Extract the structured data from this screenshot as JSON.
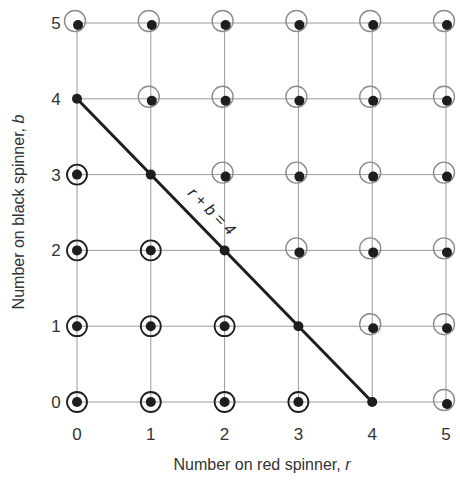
{
  "chart_data": {
    "type": "scatter",
    "title": "",
    "xlabel": "Number on red spinner, r",
    "ylabel": "Number on black spinner, b",
    "xlabel_text": "Number on red spinner, ",
    "xlabel_var": "r",
    "ylabel_text": "Number on black spinner, ",
    "ylabel_var": "b",
    "x_ticks": [
      "0",
      "1",
      "2",
      "3",
      "4",
      "5"
    ],
    "y_ticks": [
      "0",
      "1",
      "2",
      "3",
      "4",
      "5"
    ],
    "xlim": [
      0,
      5
    ],
    "ylim": [
      0,
      5
    ],
    "grid": true,
    "line": {
      "label": "r + b = 4",
      "from": [
        0,
        4
      ],
      "to": [
        4,
        0
      ]
    },
    "point_groups": [
      {
        "name": "r + b < 4 (dark concentric circle)",
        "marker": "dot-in-dark-circle",
        "points": [
          [
            0,
            0
          ],
          [
            1,
            0
          ],
          [
            2,
            0
          ],
          [
            3,
            0
          ],
          [
            0,
            1
          ],
          [
            1,
            1
          ],
          [
            2,
            1
          ],
          [
            0,
            2
          ],
          [
            1,
            2
          ],
          [
            0,
            3
          ]
        ]
      },
      {
        "name": "r + b = 4 (on line, plain dot)",
        "marker": "dot",
        "points": [
          [
            4,
            0
          ],
          [
            3,
            1
          ],
          [
            2,
            2
          ],
          [
            1,
            3
          ],
          [
            0,
            4
          ]
        ]
      },
      {
        "name": "r + b > 4 (light offset circle)",
        "marker": "dot-in-light-offset-circle",
        "points": [
          [
            5,
            0
          ],
          [
            4,
            1
          ],
          [
            5,
            1
          ],
          [
            3,
            2
          ],
          [
            4,
            2
          ],
          [
            5,
            2
          ],
          [
            2,
            3
          ],
          [
            3,
            3
          ],
          [
            4,
            3
          ],
          [
            5,
            3
          ],
          [
            1,
            4
          ],
          [
            2,
            4
          ],
          [
            3,
            4
          ],
          [
            4,
            4
          ],
          [
            5,
            4
          ],
          [
            0,
            5
          ],
          [
            1,
            5
          ],
          [
            2,
            5
          ],
          [
            3,
            5
          ],
          [
            4,
            5
          ],
          [
            5,
            5
          ]
        ]
      }
    ]
  },
  "colors": {
    "grid": "#9a9a9a",
    "dot": "#1e1e1e",
    "dark_circle": "#1e1e1e",
    "light_circle": "#8c8c8c",
    "line": "#1e1e1e"
  }
}
